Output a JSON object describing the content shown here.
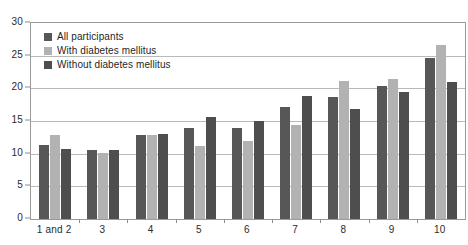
{
  "chart_data": {
    "type": "bar",
    "title": "",
    "subtitle": "",
    "xlabel": "",
    "ylabel": "",
    "ylim": [
      0,
      30
    ],
    "y_ticks": [
      0,
      5,
      10,
      15,
      20,
      25,
      30
    ],
    "grid": true,
    "legend_position": "top-left-inside",
    "categories": [
      "1 and 2",
      "3",
      "4",
      "5",
      "6",
      "7",
      "8",
      "9",
      "10"
    ],
    "series": [
      {
        "name": "All participants",
        "color": "#575757",
        "values": [
          11.3,
          10.5,
          12.8,
          14.0,
          13.9,
          17.1,
          18.7,
          20.3,
          24.7
        ]
      },
      {
        "name": "With diabetes mellitus",
        "color": "#b2b2b2",
        "values": [
          12.8,
          10.1,
          12.8,
          11.2,
          11.9,
          14.4,
          21.2,
          21.5,
          26.6
        ]
      },
      {
        "name": "Without diabetes mellitus",
        "color": "#4e4e4e",
        "values": [
          10.7,
          10.6,
          13.0,
          15.6,
          15.0,
          18.8,
          16.8,
          19.5,
          21.0
        ]
      }
    ]
  }
}
